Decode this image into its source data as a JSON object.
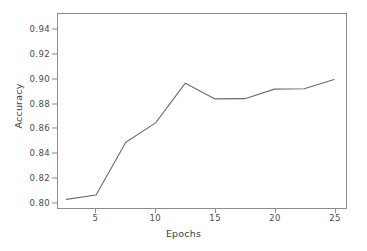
{
  "chart_data": {
    "type": "line",
    "title": "",
    "xlabel": "Epochs",
    "ylabel": "Accuracy",
    "x": [
      2.5,
      5,
      7.5,
      10,
      12.5,
      15,
      17.5,
      20,
      22.5,
      25
    ],
    "values": [
      0.8025,
      0.806,
      0.8487,
      0.8644,
      0.8965,
      0.8838,
      0.884,
      0.8917,
      0.892,
      0.8995
    ],
    "series": [
      {
        "name": "Accuracy",
        "color": "#6b6b6b",
        "values": [
          0.8025,
          0.806,
          0.8487,
          0.8644,
          0.8965,
          0.8838,
          0.884,
          0.8917,
          0.892,
          0.8995
        ]
      }
    ],
    "xlim": [
      1.8,
      26.0
    ],
    "ylim": [
      0.7955,
      0.9525
    ],
    "xticks": [
      5,
      10,
      15,
      20,
      25
    ],
    "xtick_labels": [
      "5",
      "10",
      "15",
      "20",
      "25"
    ],
    "yticks": [
      0.8,
      0.82,
      0.84,
      0.86,
      0.88,
      0.9,
      0.92,
      0.94
    ],
    "ytick_labels": [
      "0.80",
      "0.82",
      "0.84",
      "0.86",
      "0.88",
      "0.90",
      "0.92",
      "0.94"
    ],
    "grid": false,
    "legend": false,
    "legend_position": "none",
    "line_color": "#6b6b6b",
    "axis_color": "#8c8c8c",
    "background_color": "#ffffff"
  }
}
